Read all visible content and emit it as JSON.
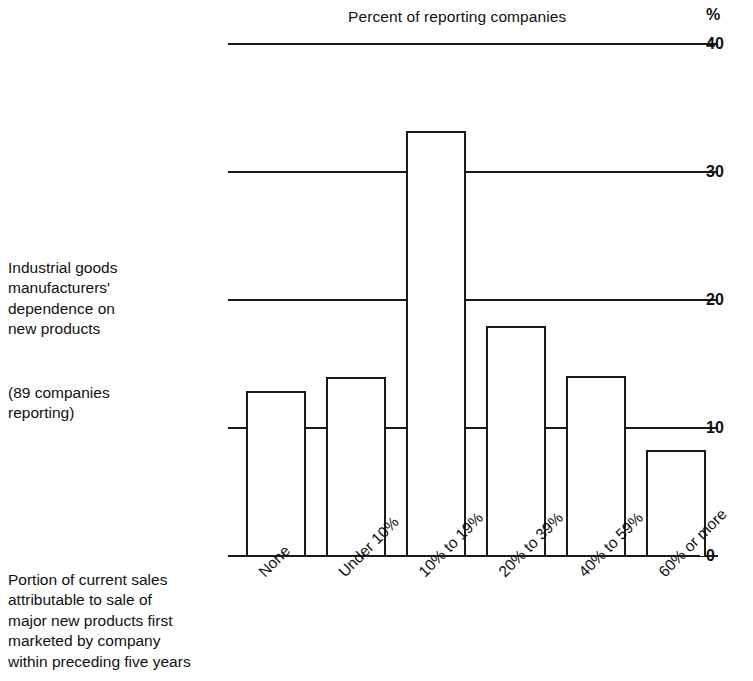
{
  "chart_data": {
    "type": "bar",
    "title": "Percent of reporting companies",
    "xlabel": "Portion of current sales attributable to sale of major new products first marketed by company within preceding five years",
    "ylabel": "%",
    "categories": [
      "None",
      "Under 10%",
      "10% to 19%",
      "20% to 39%",
      "40% to 59%",
      "60% or more"
    ],
    "values": [
      12.9,
      14.0,
      33.2,
      18.0,
      14.1,
      8.3
    ],
    "ylim": [
      0,
      40
    ],
    "yticks": [
      0,
      10,
      20,
      30,
      40
    ],
    "ytick_labels": [
      "0",
      "10",
      "20",
      "30",
      "40"
    ],
    "grid": true,
    "legend": "none",
    "series_color": "#ffffff",
    "line_color": "#1a1a1a",
    "unit_symbol": "%"
  },
  "captions": {
    "main": "Industrial goods\nmanufacturers'\ndependence on\nnew products",
    "sub": "(89 companies\nreporting)",
    "axis": "Portion of current sales\nattributable to sale of\nmajor new products first\nmarketed by company\nwithin preceding five years"
  }
}
